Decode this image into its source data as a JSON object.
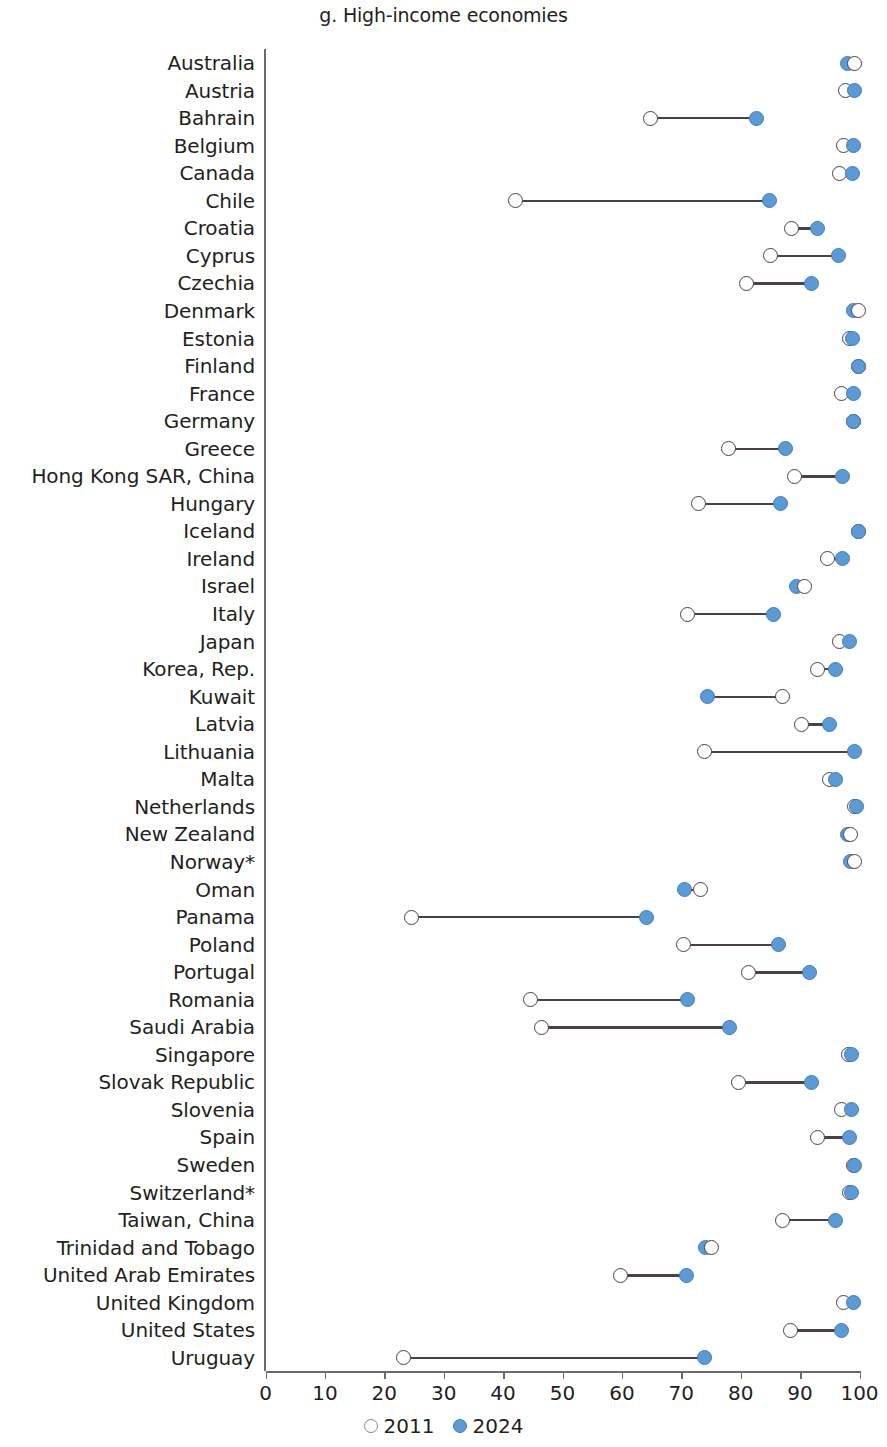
{
  "chart_data": {
    "type": "scatter",
    "subtype": "dumbbell",
    "title": "g. High-income economies",
    "xlabel": "",
    "ylabel": "",
    "xlim": [
      0,
      100
    ],
    "xticks": [
      0,
      10,
      20,
      30,
      40,
      50,
      60,
      70,
      80,
      90,
      100
    ],
    "grid": false,
    "legend_position": "bottom-center",
    "series": [
      {
        "name": "2011",
        "marker": "open-circle",
        "color": "#ffffff",
        "edge_color": "#4a4045"
      },
      {
        "name": "2024",
        "marker": "filled-circle",
        "color": "#5b9bd5",
        "edge_color": "#3f7ebd"
      }
    ],
    "categories": [
      "Australia",
      "Austria",
      "Bahrain",
      "Belgium",
      "Canada",
      "Chile",
      "Croatia",
      "Cyprus",
      "Czechia",
      "Denmark",
      "Estonia",
      "Finland",
      "France",
      "Germany",
      "Greece",
      "Hong Kong SAR, China",
      "Hungary",
      "Iceland",
      "Ireland",
      "Israel",
      "Italy",
      "Japan",
      "Korea, Rep.",
      "Kuwait",
      "Latvia",
      "Lithuania",
      "Malta",
      "Netherlands",
      "New Zealand",
      "Norway*",
      "Oman",
      "Panama",
      "Poland",
      "Portugal",
      "Romania",
      "Saudi Arabia",
      "Singapore",
      "Slovak Republic",
      "Slovenia",
      "Spain",
      "Sweden",
      "Switzerland*",
      "Taiwan, China",
      "Trinidad and Tobago",
      "United Arab Emirates",
      "United Kingdom",
      "United States",
      "Uruguay"
    ],
    "values_2011": [
      99.1,
      97.7,
      64.8,
      97.3,
      96.7,
      42.1,
      88.6,
      85.0,
      80.9,
      99.8,
      98.3,
      99.9,
      97.0,
      99.0,
      77.9,
      89.0,
      72.9,
      99.9,
      94.6,
      90.7,
      71.1,
      96.6,
      93.0,
      87.0,
      90.2,
      73.9,
      95.0,
      99.1,
      98.5,
      99.2,
      73.2,
      24.6,
      70.3,
      81.3,
      44.6,
      46.4,
      98.2,
      79.7,
      97.0,
      93.0,
      99.0,
      98.3,
      87.1,
      75.1,
      59.8,
      97.3,
      88.4,
      23.3
    ],
    "values_2024": [
      98.0,
      99.2,
      82.6,
      99.0,
      98.9,
      84.8,
      93.0,
      96.5,
      92.0,
      99.0,
      98.9,
      99.9,
      99.0,
      99.0,
      87.6,
      97.2,
      86.7,
      99.9,
      97.1,
      89.4,
      85.6,
      98.4,
      96.0,
      74.4,
      95.0,
      99.2,
      96.0,
      99.5,
      98.0,
      98.5,
      70.5,
      64.1,
      86.4,
      91.5,
      71.0,
      78.1,
      98.6,
      92.0,
      98.7,
      98.3,
      99.2,
      98.6,
      95.9,
      74.0,
      70.9,
      99.0,
      97.0,
      73.9
    ]
  },
  "legend": {
    "items": [
      {
        "label": "2011",
        "key": "legend-2011"
      },
      {
        "label": "2024",
        "key": "legend-2024"
      }
    ]
  }
}
